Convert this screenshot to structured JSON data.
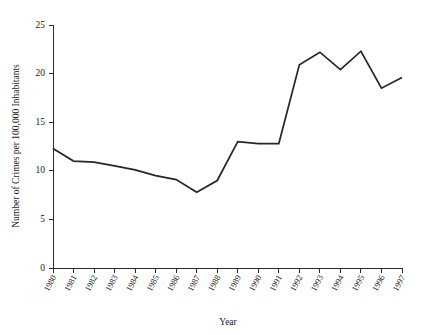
{
  "chart_data": {
    "type": "line",
    "title": "",
    "xlabel": "Year",
    "ylabel": "Number of Crimes per 100,000 Inhabitants",
    "categories": [
      "1980",
      "1981",
      "1982",
      "1983",
      "1984",
      "1985",
      "1986",
      "1987",
      "1988",
      "1989",
      "1990",
      "1991",
      "1992",
      "1993",
      "1994",
      "1995",
      "1996",
      "1997"
    ],
    "x": [
      1980,
      1981,
      1982,
      1983,
      1984,
      1985,
      1986,
      1987,
      1988,
      1989,
      1990,
      1991,
      1992,
      1993,
      1994,
      1995,
      1996,
      1997
    ],
    "values": [
      12.3,
      11.0,
      10.9,
      10.5,
      10.1,
      9.5,
      9.1,
      7.8,
      9.0,
      13.0,
      12.8,
      12.8,
      20.9,
      22.2,
      20.4,
      22.3,
      18.5,
      19.6
    ],
    "series": [
      {
        "name": "Crime rate",
        "values": [
          12.3,
          11.0,
          10.9,
          10.5,
          10.1,
          9.5,
          9.1,
          7.8,
          9.0,
          13.0,
          12.8,
          12.8,
          20.9,
          22.2,
          20.4,
          22.3,
          18.5,
          19.6
        ],
        "color": "#262626"
      }
    ],
    "ylim": [
      0,
      25
    ],
    "yticks": [
      0,
      5,
      10,
      15,
      20,
      25
    ],
    "ytick_labels": [
      "0",
      "5",
      "10",
      "15",
      "20",
      "25"
    ],
    "xlim": [
      1980,
      1997
    ],
    "grid": false,
    "legend": false,
    "legend_position": "none"
  },
  "style": {
    "line_color": "#262626",
    "axis_color": "#2b2b2b",
    "background": "#ffffff",
    "text_color": "#1a1a1a"
  }
}
